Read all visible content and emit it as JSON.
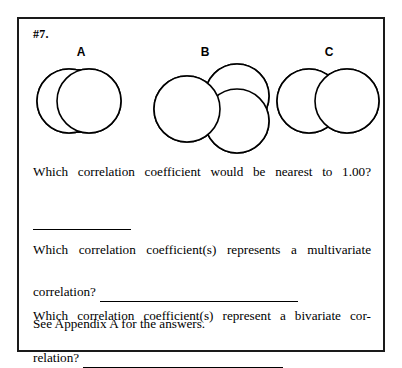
{
  "worksheet": {
    "item_number": "#7.",
    "border_color": "#1a1a1a",
    "background_color": "#ffffff",
    "ink_color": "#000000"
  },
  "diagrams": [
    {
      "label": "A",
      "name": "venn-diagram-a",
      "circle_count": 2,
      "overlap_size": "large",
      "shaded_fill": "#000000",
      "description": "Two heavily overlapping circles with a large black lens-shaped intersection"
    },
    {
      "label": "B",
      "name": "venn-diagram-b",
      "circle_count": 3,
      "overlap_size": "medium",
      "shaded_fill": "#000000",
      "description": "One left circle overlapping an upper-right and a lower-right circle, intersections shaded black"
    },
    {
      "label": "C",
      "name": "venn-diagram-c",
      "circle_count": 2,
      "overlap_size": "small",
      "shaded_fill": "#000000",
      "description": "Two circles with a narrow black lens-shaped intersection"
    }
  ],
  "questions": [
    {
      "id": "q1",
      "text": "Which correlation coefficient would be nearest to 1.00?",
      "answer_value": "",
      "rule_style": "short"
    },
    {
      "id": "q2",
      "text_line_1": "Which correlation coefficient(s) represents a multivariate",
      "text_line_2": "correlation?",
      "answer_value": "",
      "rule_style": "mid"
    },
    {
      "id": "q3",
      "text_line_1": "Which correlation coefficient(s) represent a bivariate cor-",
      "text_line_2": "relation?",
      "answer_value": "",
      "rule_style": "long"
    }
  ],
  "footer": {
    "note": "See Appendix A for the answers."
  }
}
